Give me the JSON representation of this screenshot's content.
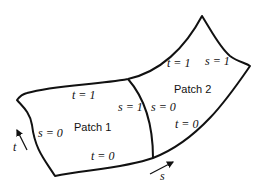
{
  "diagram": {
    "title": "",
    "patches": [
      {
        "name": "Patch 1",
        "label": "Patch 1"
      },
      {
        "name": "Patch 2",
        "label": "Patch 2"
      }
    ],
    "edge_labels": {
      "p1_top": "t = 1",
      "p1_left": "s = 0",
      "p1_bottom": "t = 0",
      "p1_right": "s = 1",
      "p2_left": "s = 0",
      "p2_top": "t = 1",
      "p2_right": "s = 1",
      "p2_bottom": "t = 0"
    },
    "axes": {
      "t_label": "t",
      "s_label": "s"
    },
    "colors": {
      "stroke": "#111111",
      "background": "#ffffff"
    }
  }
}
